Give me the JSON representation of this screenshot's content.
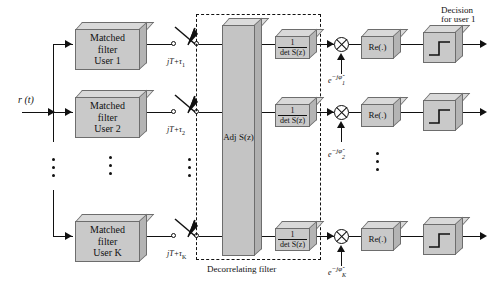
{
  "figure": {
    "input_label": "r (t)",
    "dashed_region_label": "Decorrelating filter",
    "decision_label_line1": "Decision",
    "decision_label_line2": "for user 1",
    "adjoint_label": "Adj S(z)",
    "colors": {
      "box_face": "#c9c9c9",
      "box_top": "#d9d9d9",
      "box_side": "#b4b4b4",
      "line": "#111111",
      "background": "#ffffff"
    }
  },
  "branches": [
    {
      "id": "user1",
      "matched_filter_line1": "Matched",
      "matched_filter_line2": "filter",
      "matched_filter_line3": "User 1",
      "sampler_label_main": "jT+",
      "sampler_label_tau": "τ",
      "sampler_label_sub": "1",
      "det_numerator": "1",
      "det_denominator": "det S(z)",
      "phase_label_base": "e",
      "phase_label_exp": "−jφ̂",
      "phase_label_sub": "1",
      "real_block": "Re(.)",
      "threshold_block": "threshold"
    },
    {
      "id": "user2",
      "matched_filter_line1": "Matched",
      "matched_filter_line2": "filter",
      "matched_filter_line3": "User 2",
      "sampler_label_main": "jT+",
      "sampler_label_tau": "τ",
      "sampler_label_sub": "2",
      "det_numerator": "1",
      "det_denominator": "det S(z)",
      "phase_label_base": "e",
      "phase_label_exp": "−jφ̂",
      "phase_label_sub": "2",
      "real_block": "Re(.)",
      "threshold_block": "threshold"
    },
    {
      "id": "userK",
      "matched_filter_line1": "Matched",
      "matched_filter_line2": "filter",
      "matched_filter_line3": "User K",
      "sampler_label_main": "jT+",
      "sampler_label_tau": "τ",
      "sampler_label_sub": "K",
      "det_numerator": "1",
      "det_denominator": "det S(z)",
      "phase_label_base": "e",
      "phase_label_exp": "−jφ̂",
      "phase_label_sub": "K",
      "real_block": "Re(.)",
      "threshold_block": "threshold"
    }
  ],
  "ellipses": {
    "input_bus": "vertical-dots",
    "matched_filter_column": "vertical-dots",
    "sampler_column": "vertical-dots",
    "phase_column": "vertical-dots",
    "output_column": "vertical-dots"
  }
}
